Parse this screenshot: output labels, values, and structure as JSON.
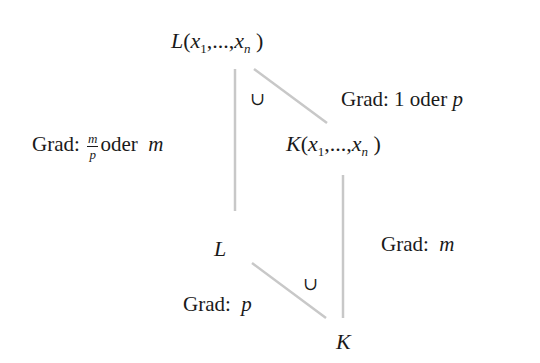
{
  "diagram": {
    "nodes": {
      "top": {
        "symbol": "L",
        "args": "x",
        "sub1": "1",
        "dots": ",...,",
        "subn": "n"
      },
      "middle_right": {
        "symbol": "K",
        "args": "x",
        "sub1": "1",
        "dots": ",...,",
        "subn": "n"
      },
      "middle_left": {
        "symbol": "L"
      },
      "bottom": {
        "symbol": "K"
      }
    },
    "edge_labels": {
      "top_diagonal": {
        "prefix": "Grad: ",
        "value1": "1",
        "conj": " oder ",
        "value2": "p"
      },
      "left_vertical": {
        "prefix": "Grad: ",
        "frac_num": "m",
        "frac_den": "p",
        "conj": "oder ",
        "value": "m"
      },
      "right_vertical": {
        "prefix": "Grad: ",
        "value": "m"
      },
      "bottom_diagonal": {
        "prefix": "Grad: ",
        "value": "p"
      }
    },
    "inclusion_symbols": {
      "upper": "∪",
      "lower": "∪"
    },
    "edge_color": "#c8c8c8",
    "text_color": "#1a1a1a"
  }
}
